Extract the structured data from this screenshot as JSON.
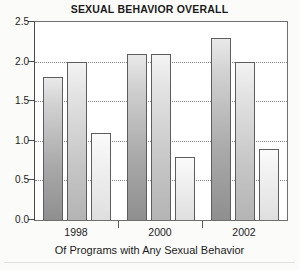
{
  "chart_data": {
    "type": "bar",
    "title": "SEXUAL BEHAVIOR OVERALL",
    "xlabel": "Of Programs with Any Sexual Behavior",
    "ylabel": "",
    "categories": [
      "1998",
      "2000",
      "2002"
    ],
    "ylim": [
      0.0,
      2.5
    ],
    "ytick_labels": [
      "0.0",
      "0.5",
      "1.0",
      "1.5",
      "2.0",
      "2.5"
    ],
    "ytick_values": [
      0.0,
      0.5,
      1.0,
      1.5,
      2.0,
      2.5
    ],
    "grid": true,
    "grid_axis": "y",
    "legend": "none",
    "series": [
      {
        "name": "series-1",
        "shade": "dark",
        "color": "#a9a9a9",
        "values": [
          1.8,
          2.1,
          2.3
        ]
      },
      {
        "name": "series-2",
        "shade": "medium",
        "color": "#c6c6c6",
        "values": [
          2.0,
          2.1,
          2.0
        ]
      },
      {
        "name": "series-3",
        "shade": "light",
        "color": "#ececec",
        "values": [
          1.1,
          0.8,
          0.9
        ]
      }
    ],
    "bar_labels": [
      {
        "group": "1998",
        "series": "series-1",
        "value": "1.8"
      },
      {
        "group": "1998",
        "series": "series-2",
        "value": "2.0"
      },
      {
        "group": "1998",
        "series": "series-3",
        "value": "1.1"
      },
      {
        "group": "2000",
        "series": "series-1",
        "value": "2.1"
      },
      {
        "group": "2000",
        "series": "series-2",
        "value": "2.1"
      },
      {
        "group": "2000",
        "series": "series-3",
        "value": "0.8"
      },
      {
        "group": "2002",
        "series": "series-1",
        "value": "2.3"
      },
      {
        "group": "2002",
        "series": "series-2",
        "value": "2.0"
      },
      {
        "group": "2002",
        "series": "series-3",
        "value": "0.9"
      }
    ]
  },
  "axis": {
    "y_ticks": [
      "0.0",
      "0.5",
      "1.0",
      "1.5",
      "2.0",
      "2.5"
    ],
    "x_groups": [
      "1998",
      "2000",
      "2002"
    ],
    "caption": "Of Programs with Any Sexual Behavior"
  },
  "colors": {
    "frame": "#6f6f6f",
    "gridline": "#8a8a8a",
    "text": "#1b1b1b",
    "bar_dark": "#a9a9a9",
    "bar_medium": "#c6c6c6",
    "bar_light": "#ececec",
    "background": "#fbfbfa"
  }
}
